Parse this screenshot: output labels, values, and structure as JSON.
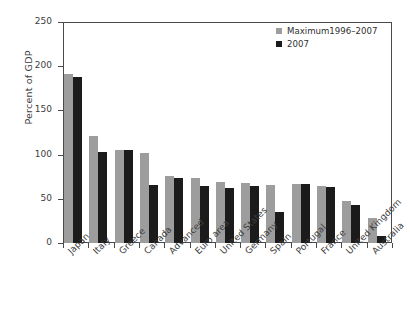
{
  "chart_data": {
    "type": "bar",
    "title": "",
    "xlabel": "",
    "ylabel": "Percent of GDP",
    "ylim": [
      0,
      250
    ],
    "yticks": [
      0,
      50,
      100,
      150,
      200,
      250
    ],
    "grid": false,
    "legend_position": "top-right",
    "categories": [
      "Japan",
      "Italy",
      "Greece",
      "Canada",
      "Advanced",
      "Euro area",
      "United States",
      "Germany",
      "Spain",
      "Portugal",
      "France",
      "United Kingdom",
      "Australia"
    ],
    "series": [
      {
        "name": "Maximum1996–2007",
        "color": "#9d9d9d",
        "values": [
          191,
          121,
          105,
          102,
          76,
          74,
          69,
          68,
          66,
          67,
          65,
          48,
          28
        ]
      },
      {
        "name": "2007",
        "color": "#1b1b1b",
        "values": [
          188,
          103,
          105,
          66,
          74,
          65,
          62,
          64,
          35,
          67,
          63,
          43,
          8
        ]
      }
    ]
  },
  "legend": {
    "entries": [
      {
        "label": "Maximum1996–2007",
        "swatch": "#9d9d9d"
      },
      {
        "label": "2007",
        "swatch": "#1b1b1b"
      }
    ]
  },
  "axes": {
    "y_title": "Percent of GDP",
    "y_tick_labels": [
      "250",
      "200",
      "150",
      "100",
      "50",
      "0"
    ]
  }
}
